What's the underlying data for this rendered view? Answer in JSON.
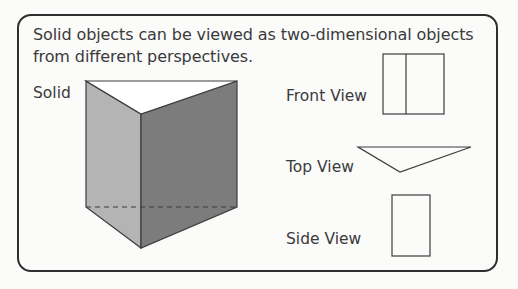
{
  "intro_text": "Solid objects can be viewed as two-dimensional objects from different perspectives.",
  "labels": {
    "solid": "Solid",
    "front_view": "Front View",
    "top_view": "Top View",
    "side_view": "Side View"
  },
  "colors": {
    "left_face": "#b4b4b4",
    "right_face": "#7c7c7c",
    "top_face": "#ffffff",
    "outline": "#3c3c3c"
  },
  "figures": {
    "solid": "triangular-prism",
    "front_view": "rectangle-with-vertical-divider",
    "top_view": "inverted-triangle",
    "side_view": "rectangle"
  }
}
